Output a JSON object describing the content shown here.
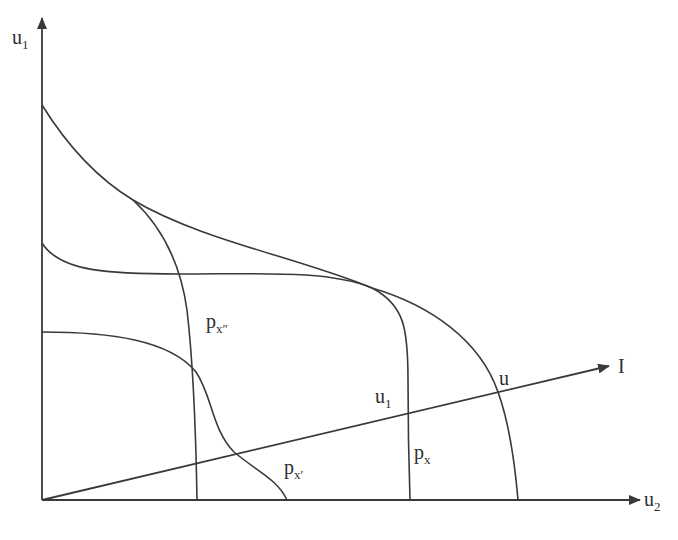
{
  "diagram": {
    "type": "utility-possibility-frontiers",
    "axes": {
      "y": {
        "label": "u",
        "subscript": "1"
      },
      "x": {
        "label": "u",
        "subscript": "2"
      }
    },
    "ray": {
      "label": "I"
    },
    "curves": [
      {
        "id": "u",
        "label": "u",
        "subscript": ""
      },
      {
        "id": "px",
        "label": "p",
        "subscript": "x"
      },
      {
        "id": "px_double_prime",
        "label": "p",
        "subscript": "x″"
      },
      {
        "id": "px_prime",
        "label": "p",
        "subscript": "x′"
      }
    ],
    "points": [
      {
        "id": "u1",
        "label": "u",
        "subscript": "1"
      }
    ],
    "stroke_color": "#3a3a3a"
  }
}
